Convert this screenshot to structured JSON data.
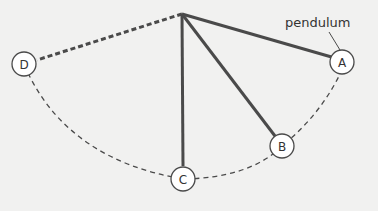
{
  "diagram": {
    "title_label": "pendulum",
    "colors": {
      "line": "#4a4a4a",
      "background": "#f1f1f0",
      "node_fill": "#ffffff"
    },
    "nodes": [
      {
        "id": "A",
        "label": "A"
      },
      {
        "id": "B",
        "label": "B"
      },
      {
        "id": "C",
        "label": "C"
      },
      {
        "id": "D",
        "label": "D"
      }
    ]
  }
}
